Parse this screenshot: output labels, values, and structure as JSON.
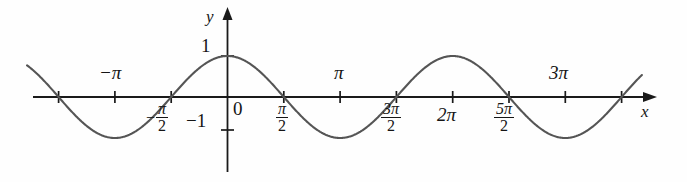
{
  "figure": {
    "kind": "cartesian-plot",
    "background_color": "#fefefe",
    "curve_color": "#555555",
    "axis_color": "#1a1a1a",
    "text_color": "#151515"
  },
  "axes": {
    "x_axis_label": "x",
    "y_axis_label": "y",
    "origin_label": "0"
  },
  "y_ticks": [
    {
      "label": "1",
      "value": 1
    },
    {
      "label": "-1",
      "value": -1
    }
  ],
  "x_ticks": [
    {
      "label": "",
      "value": -1.5,
      "unit": "pi",
      "show_label": false
    },
    {
      "label": "-π",
      "value": -1.0,
      "unit": "pi",
      "show_label": true,
      "position": "above"
    },
    {
      "label": "π",
      "value": -0.5,
      "unit": "pi",
      "show_label": true,
      "position": "below",
      "fraction": true,
      "numerator": "π",
      "denominator": "2",
      "sign": "−"
    },
    {
      "label": "π",
      "value": 0.5,
      "unit": "pi",
      "show_label": true,
      "position": "below",
      "fraction": true,
      "numerator": "π",
      "denominator": "2",
      "sign": ""
    },
    {
      "label": "π",
      "value": 1.0,
      "unit": "pi",
      "show_label": true,
      "position": "above"
    },
    {
      "label": "3π",
      "value": 1.5,
      "unit": "pi",
      "show_label": true,
      "position": "below",
      "fraction": true,
      "numerator": "3π",
      "denominator": "2",
      "sign": ""
    },
    {
      "label": "2π",
      "value": 2.0,
      "unit": "pi",
      "show_label": true,
      "position": "below"
    },
    {
      "label": "5π",
      "value": 2.5,
      "unit": "pi",
      "show_label": true,
      "position": "below",
      "fraction": true,
      "numerator": "5π",
      "denominator": "2",
      "sign": ""
    },
    {
      "label": "3π",
      "value": 3.0,
      "unit": "pi",
      "show_label": true,
      "position": "above"
    }
  ],
  "labels": {
    "neg_pi": "−π",
    "pi": "π",
    "two_pi": "2π",
    "three_pi": "3π",
    "one": "1",
    "neg_one": "−1",
    "zero": "0",
    "x": "x",
    "y": "y",
    "minus_sign": "−",
    "pi_glyph": "π",
    "two": "2",
    "three_pi_num": "3π",
    "five_pi_num": "5π"
  },
  "chart_data": {
    "type": "line",
    "title": "",
    "xlabel": "x",
    "ylabel": "y",
    "grid": false,
    "legend": null,
    "function": "y = cos(x)",
    "xlim_pi_units": [
      -1.78,
      3.68
    ],
    "ylim": [
      -1.25,
      1.35
    ],
    "x_tick_values_pi_units": [
      -1.5,
      -1.0,
      -0.5,
      0.5,
      1.0,
      1.5,
      2.0,
      2.5,
      3.0,
      3.5
    ],
    "x_tick_labels": [
      "",
      "-π",
      "-π/2",
      "π/2",
      "π",
      "3π/2",
      "2π",
      "5π/2",
      "3π",
      ""
    ],
    "y_tick_values": [
      1,
      -1
    ],
    "y_tick_labels": [
      "1",
      "-1"
    ],
    "series": [
      {
        "name": "y = cos(x)",
        "color": "#555555",
        "x_pi_units": [
          -1.78,
          -1.5,
          -1.0,
          -0.5,
          0.0,
          0.5,
          1.0,
          1.5,
          2.0,
          2.5,
          3.0,
          3.5,
          3.68
        ],
        "values": [
          -0.66,
          0,
          1,
          0,
          1,
          0,
          -1,
          0,
          1,
          0,
          -1,
          0,
          0.52
        ]
      }
    ],
    "key_points": [
      {
        "x_pi_units": -1.5,
        "y": 0,
        "kind": "zero-crossing"
      },
      {
        "x_pi_units": -1.0,
        "y": -1,
        "kind": "minimum"
      },
      {
        "x_pi_units": -0.5,
        "y": 0,
        "kind": "zero-crossing"
      },
      {
        "x_pi_units": 0.0,
        "y": 1,
        "kind": "maximum"
      },
      {
        "x_pi_units": 0.5,
        "y": 0,
        "kind": "zero-crossing"
      },
      {
        "x_pi_units": 1.0,
        "y": -1,
        "kind": "minimum"
      },
      {
        "x_pi_units": 1.5,
        "y": 0,
        "kind": "zero-crossing"
      },
      {
        "x_pi_units": 2.0,
        "y": 1,
        "kind": "maximum"
      },
      {
        "x_pi_units": 2.5,
        "y": 0,
        "kind": "zero-crossing"
      },
      {
        "x_pi_units": 3.0,
        "y": -1,
        "kind": "minimum"
      },
      {
        "x_pi_units": 3.5,
        "y": 0,
        "kind": "zero-crossing"
      }
    ]
  }
}
